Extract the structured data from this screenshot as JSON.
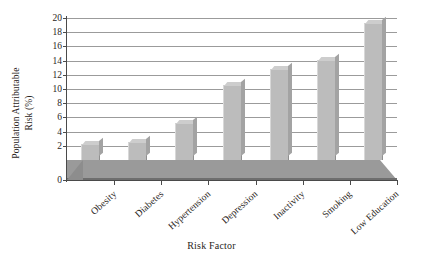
{
  "chart_data": {
    "type": "bar",
    "title": "",
    "xlabel": "Risk Factor",
    "ylabel_line1": "Population Attributable",
    "ylabel_line2": "Risk (%)",
    "categories": [
      "Obesity",
      "Diabetes",
      "Hypertension",
      "Depression",
      "Inactivity",
      "Smoking",
      "Low Education"
    ],
    "values": [
      2.2,
      2.5,
      5.2,
      10.6,
      12.8,
      14.1,
      19.3
    ],
    "ylim": [
      0,
      20
    ],
    "ytick_labels": [
      "0",
      "2",
      "4",
      "6",
      "8",
      "10",
      "12",
      "14",
      "16",
      "18",
      "20"
    ],
    "ytick_values": [
      0,
      2,
      4,
      6,
      8,
      10,
      12,
      14,
      16,
      18,
      20
    ],
    "grid": true,
    "legend": "none",
    "series_name": "Population Attributable Risk",
    "bar_color": "#bcbcbc",
    "grid_color": "#9b9b9b",
    "axis_color": "#4a4a4a",
    "floor_color": "#9a9a9a",
    "background": "#ffffff"
  }
}
